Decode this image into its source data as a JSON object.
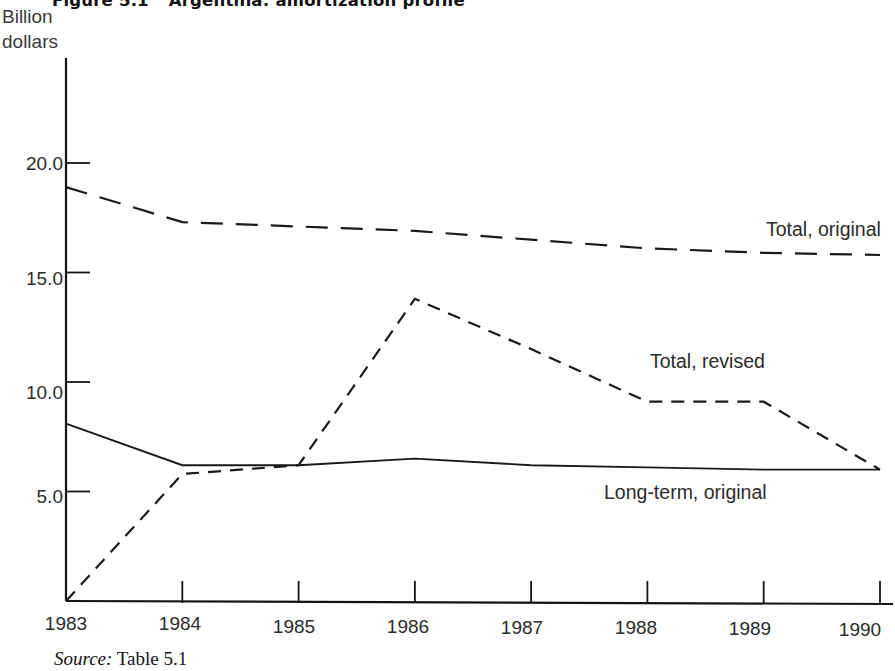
{
  "figure": {
    "number": "Figure 5.1",
    "title": "Argentina: amortization profile",
    "source_prefix": "Source:",
    "source_text": "Table 5.1",
    "axis_unit_label": "Billion\ndollars"
  },
  "chart_data": {
    "type": "line",
    "title": "Argentina: amortization profile",
    "xlabel": "",
    "ylabel": "Billion dollars",
    "ylim": [
      0,
      24.5
    ],
    "xlim": [
      1983,
      1990
    ],
    "grid": false,
    "legend_position": "inline-right",
    "yticks": [
      "5.0",
      "10.0",
      "15.0",
      "20.0"
    ],
    "ytick_values": [
      5.0,
      10.0,
      15.0,
      20.0
    ],
    "categories": [
      "1983",
      "1984",
      "1985",
      "1986",
      "1987",
      "1988",
      "1989",
      "1990"
    ],
    "x": [
      1983,
      1984,
      1985,
      1986,
      1987,
      1988,
      1989,
      1990
    ],
    "series": [
      {
        "name": "Total, original",
        "style": "long-dashed",
        "values": [
          18.9,
          17.3,
          17.1,
          16.9,
          16.5,
          16.1,
          15.9,
          15.8
        ]
      },
      {
        "name": "Total, revised",
        "style": "short-dashed",
        "values": [
          0.0,
          5.8,
          6.2,
          13.8,
          11.5,
          9.1,
          9.1,
          6.0
        ]
      },
      {
        "name": "Long-term, original",
        "style": "solid",
        "values": [
          8.1,
          6.2,
          6.2,
          6.5,
          6.2,
          6.1,
          6.0,
          6.0
        ]
      }
    ]
  },
  "colors": {
    "ink": "#1a1a1a",
    "axis": "#111111",
    "background": "#ffffff"
  }
}
